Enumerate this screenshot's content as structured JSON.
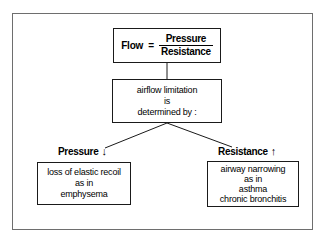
{
  "figure": {
    "background_color": "#ffffff",
    "frame_color": "#6e6e6e",
    "line_color": "#1a1a1a"
  },
  "formula": {
    "lhs": "Flow",
    "equals": "=",
    "numerator": "Pressure",
    "denominator": "Resistance"
  },
  "middle": {
    "lines": [
      "airflow limitation",
      "is",
      "determined by :"
    ]
  },
  "branches": {
    "left": {
      "label": "Pressure",
      "arrow": "↓",
      "arrow_name": "down-arrow-icon",
      "lines": [
        "loss of elastic recoil",
        "as in",
        "emphysema"
      ]
    },
    "right": {
      "label": "Resistance",
      "arrow": "↑",
      "arrow_name": "up-arrow-icon",
      "lines": [
        "airway narrowing",
        "as in",
        "asthma",
        "chronic bronchitis"
      ]
    }
  }
}
